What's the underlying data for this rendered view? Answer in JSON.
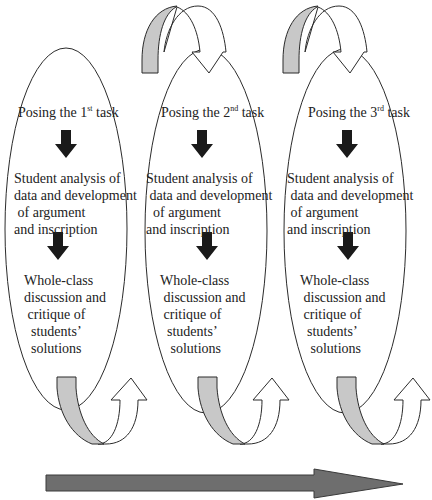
{
  "diagram": {
    "type": "iterative-cycle-flow",
    "cycles": [
      {
        "label_prefix": "Posing the 1",
        "label_sup": "st",
        "label_suffix": " task",
        "step2": "Student analysis of\ndata and development\n of argument\nand inscription",
        "step3": "Whole-class\ndiscussion and\n critique of\n  students’\n  solutions"
      },
      {
        "label_prefix": "Posing the 2",
        "label_sup": "nd",
        "label_suffix": " task",
        "step2": "Student analysis of\n data and development\n  of argument\nand inscription",
        "step3": "Whole-class\n discussion and\n critique of\n  students’\n   solutions"
      },
      {
        "label_prefix": "Posing the 3",
        "label_sup": "rd",
        "label_suffix": " task",
        "step2": "Student analysis of\n data and development\n of argument\nand inscription",
        "step3": "Whole-class\n discussion and\n critique of\n  students’\n   solutions"
      }
    ],
    "connectors": {
      "top_curved_arrows": 2,
      "bottom_curved_arrows": 3,
      "down_arrows_per_cycle": 2
    },
    "progress_arrow": {
      "direction": "right",
      "label": ""
    },
    "colors": {
      "outline": "#2b2b2b",
      "band_fill": "#c8c8c8",
      "down_arrow": "#1a1a1a",
      "progress_arrow": "#6e6e6e",
      "background": "#ffffff"
    }
  }
}
